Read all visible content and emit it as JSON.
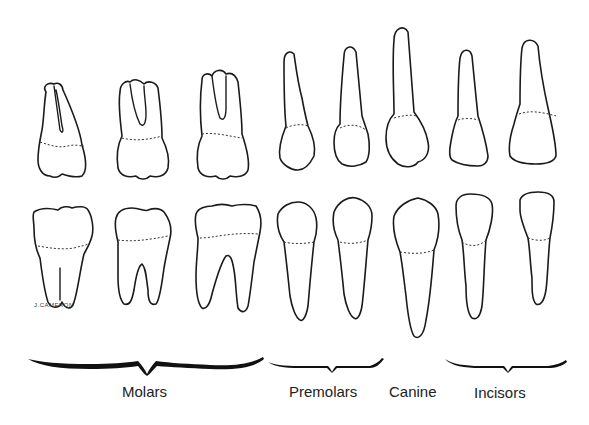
{
  "diagram": {
    "signature": "J.CAMERON",
    "groups": [
      {
        "name": "molars",
        "label": "Molars",
        "count": 3
      },
      {
        "name": "premolars",
        "label": "Premolars",
        "count": 2
      },
      {
        "name": "canine",
        "label": "Canine",
        "count": 1
      },
      {
        "name": "incisors",
        "label": "Incisors",
        "count": 2
      }
    ],
    "rows": [
      "upper",
      "lower"
    ],
    "colors": {
      "line": "#1a1a1a",
      "background": "#ffffff"
    }
  }
}
